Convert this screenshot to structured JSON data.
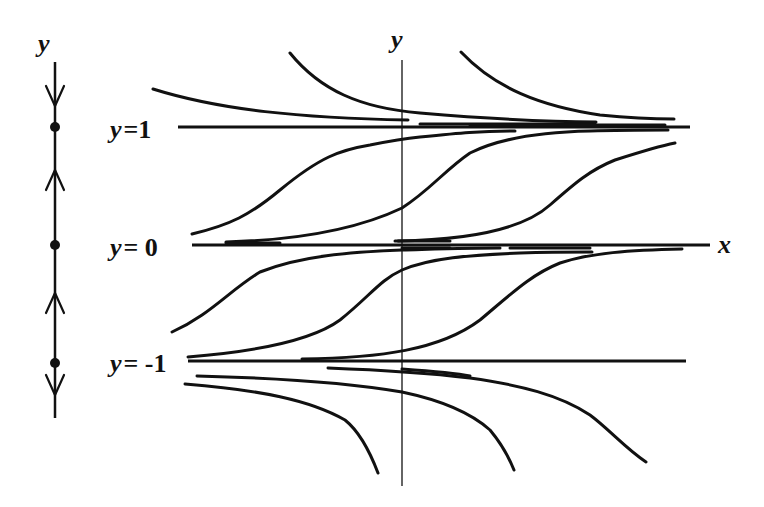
{
  "figure": {
    "type": "phase-line-and-solution-curves",
    "phase_line": {
      "axis_label": "y",
      "equilibria": [
        {
          "value": 1,
          "label_var": "y",
          "label_eq": "=",
          "label_val": "1",
          "stability": "stable"
        },
        {
          "value": 0,
          "label_var": "y",
          "label_eq": "=",
          "label_val": "0",
          "stability": "semi-stable"
        },
        {
          "value": -1,
          "label_var": "y",
          "label_eq": "=",
          "label_val": "-1",
          "stability": "semi-stable"
        }
      ],
      "arrows": [
        {
          "region": "y > 1",
          "direction": "down"
        },
        {
          "region": "0 < y < 1",
          "direction": "up"
        },
        {
          "region": "-1 < y < 0",
          "direction": "up"
        },
        {
          "region": "y < -1",
          "direction": "down"
        }
      ]
    },
    "plane": {
      "x_axis_label": "x",
      "y_axis_label": "y",
      "equilibrium_lines": [
        "y = 1",
        "y = 0",
        "y = -1"
      ],
      "solution_families": [
        {
          "region": "y > 1",
          "behavior": "decreasing, approaching y = 1",
          "count": 3
        },
        {
          "region": "0 < y < 1",
          "behavior": "increasing S-curves from y = 0 to y = 1",
          "count": 3
        },
        {
          "region": "-1 < y < 0",
          "behavior": "increasing S-curves from y = -1 to y = 0",
          "count": 3
        },
        {
          "region": "y < -1",
          "behavior": "decreasing away from y = -1",
          "count": 3
        }
      ]
    }
  },
  "labels": {
    "phase_y": "y",
    "axis_y": "y",
    "axis_x": "x",
    "eq1_var": "y",
    "eq1_rest": "=1",
    "eq0_var": "y",
    "eq0_rest": "= 0",
    "eqm1_var": "y",
    "eqm1_rest": "= -1"
  },
  "colors": {
    "ink": "#111111",
    "background": "#ffffff"
  }
}
